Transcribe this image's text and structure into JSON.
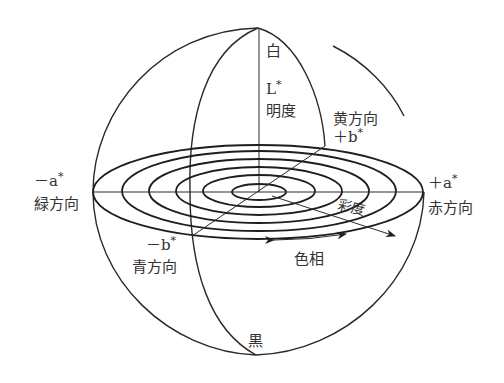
{
  "diagram": {
    "colors": {
      "line": "#2a2a2a",
      "text": "#333333",
      "background": "#ffffff"
    },
    "axes": {
      "L": {
        "top_label": "白",
        "bottom_label": "黒",
        "symbol": "L",
        "star": "*",
        "name": "明度"
      },
      "a_pos": {
        "sign": "＋a",
        "star": "*",
        "name": "赤方向"
      },
      "a_neg": {
        "sign": "－a",
        "star": "*",
        "name": "緑方向"
      },
      "b_pos": {
        "name": "黄方向",
        "sign": "＋b",
        "star": "*"
      },
      "b_neg": {
        "sign": "－b",
        "star": "*",
        "name": "青方向"
      }
    },
    "annotations": {
      "chroma": "彩度",
      "hue": "色相"
    },
    "rings": {
      "count": 6
    }
  }
}
